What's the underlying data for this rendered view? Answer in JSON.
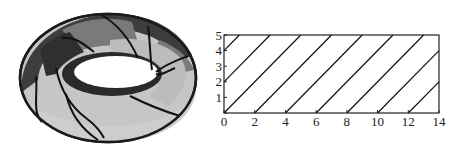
{
  "figure": {
    "left_panel": {
      "description": "Shaded 3D torus with spiral curves on its surface",
      "colors": {
        "dark": "#3a3a3a",
        "mid": "#7d7d7d",
        "light": "#bdbdbd",
        "lighter": "#cfcfcf",
        "hole": "#ffffff",
        "curve": "#111111"
      }
    },
    "right_panel": {
      "x_ticks": [
        "0",
        "2",
        "4",
        "6",
        "8",
        "10",
        "12",
        "14"
      ],
      "y_ticks": [
        "0",
        "1",
        "2",
        "3",
        "4",
        "5"
      ]
    }
  },
  "chart_data": {
    "type": "line",
    "title": "",
    "xlabel": "",
    "ylabel": "",
    "xlim": [
      0,
      14
    ],
    "ylim": [
      0,
      5
    ],
    "grid": false,
    "x_ticks": [
      0,
      2,
      4,
      6,
      8,
      10,
      12,
      14
    ],
    "y_ticks": [
      0,
      1,
      2,
      3,
      4,
      5
    ],
    "series": [
      {
        "name": "y=x+4",
        "x": [
          0,
          1
        ],
        "y": [
          4,
          5
        ]
      },
      {
        "name": "y=x+2",
        "x": [
          0,
          3
        ],
        "y": [
          2,
          5
        ]
      },
      {
        "name": "y=x",
        "x": [
          0,
          5
        ],
        "y": [
          0,
          5
        ]
      },
      {
        "name": "y=x-2",
        "x": [
          2,
          7
        ],
        "y": [
          0,
          5
        ]
      },
      {
        "name": "y=x-4",
        "x": [
          4,
          9
        ],
        "y": [
          0,
          5
        ]
      },
      {
        "name": "y=x-6",
        "x": [
          6,
          11
        ],
        "y": [
          0,
          5
        ]
      },
      {
        "name": "y=x-8",
        "x": [
          8,
          13
        ],
        "y": [
          0,
          5
        ]
      },
      {
        "name": "y=x-10",
        "x": [
          10,
          14
        ],
        "y": [
          0,
          4
        ]
      },
      {
        "name": "y=x-12",
        "x": [
          12,
          14
        ],
        "y": [
          0,
          2
        ]
      }
    ]
  }
}
